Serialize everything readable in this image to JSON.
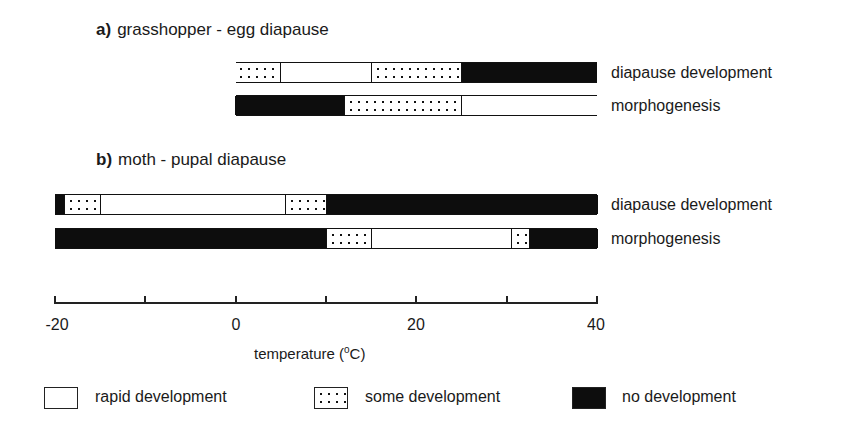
{
  "chart_data": {
    "type": "gantt-bar",
    "axis": {
      "xmin": -20,
      "xmax": 40,
      "ticks": [
        -20,
        -10,
        0,
        10,
        20,
        30,
        40
      ],
      "tick_labels": [
        "-20",
        "0",
        "20",
        "40"
      ],
      "xlabel": "temperature (°C)"
    },
    "legend": [
      {
        "key": "white",
        "label": "rapid development"
      },
      {
        "key": "dots",
        "label": "some development"
      },
      {
        "key": "black",
        "label": "no development"
      }
    ],
    "panels": [
      {
        "id": "a",
        "letter": "a)",
        "title": "grasshopper - egg diapause",
        "rows": [
          {
            "label": "diapause development",
            "segments": [
              {
                "from": 0,
                "to": 5,
                "type": "dots"
              },
              {
                "from": 5,
                "to": 15,
                "type": "white"
              },
              {
                "from": 15,
                "to": 25,
                "type": "dots"
              },
              {
                "from": 25,
                "to": 40,
                "type": "black"
              }
            ]
          },
          {
            "label": "morphogenesis",
            "segments": [
              {
                "from": 0,
                "to": 12,
                "type": "black"
              },
              {
                "from": 12,
                "to": 25,
                "type": "dots"
              },
              {
                "from": 25,
                "to": 40,
                "type": "white"
              }
            ]
          }
        ]
      },
      {
        "id": "b",
        "letter": "b)",
        "title": "moth - pupal diapause",
        "rows": [
          {
            "label": "diapause development",
            "segments": [
              {
                "from": -20,
                "to": -19,
                "type": "black"
              },
              {
                "from": -19,
                "to": -15,
                "type": "dots"
              },
              {
                "from": -15,
                "to": 5.5,
                "type": "white"
              },
              {
                "from": 5.5,
                "to": 10,
                "type": "dots"
              },
              {
                "from": 10,
                "to": 40,
                "type": "black"
              }
            ]
          },
          {
            "label": "morphogenesis",
            "segments": [
              {
                "from": -20,
                "to": 10,
                "type": "black"
              },
              {
                "from": 10,
                "to": 15,
                "type": "dots"
              },
              {
                "from": 15,
                "to": 30.5,
                "type": "white"
              },
              {
                "from": 30.5,
                "to": 32.5,
                "type": "dots"
              },
              {
                "from": 32.5,
                "to": 40,
                "type": "black"
              }
            ]
          }
        ]
      }
    ]
  },
  "panel_a": {
    "letter": "a)",
    "title": "grasshopper - egg diapause",
    "row1": "diapause development",
    "row2": "morphogenesis"
  },
  "panel_b": {
    "letter": "b)",
    "title": "moth - pupal diapause",
    "row1": "diapause development",
    "row2": "morphogenesis"
  },
  "axis": {
    "t_m20": "-20",
    "t_0": "0",
    "t_20": "20",
    "t_40": "40",
    "xlabel_main": "temperature (",
    "xlabel_unit": "o",
    "xlabel_end": "C)"
  },
  "legend": {
    "rapid": "rapid development",
    "some": "some development",
    "none": "no development"
  }
}
